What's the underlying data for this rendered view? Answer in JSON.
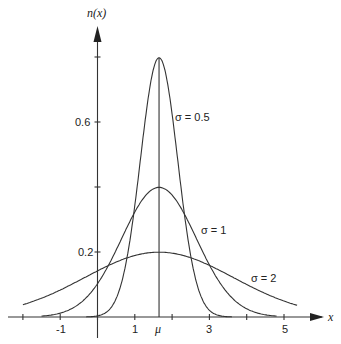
{
  "chart_data": {
    "type": "line",
    "title": "",
    "xlabel": "x",
    "ylabel": "n(x)",
    "xlim": [
      -2.4,
      5.8
    ],
    "ylim": [
      0,
      0.9
    ],
    "x_ticks": [
      -2,
      -1,
      0,
      1,
      2,
      3,
      4,
      5
    ],
    "x_tick_labels": [
      {
        "value": -1,
        "label": "-1"
      },
      {
        "value": 1,
        "label": "1"
      },
      {
        "value": 1.65,
        "label": "μ"
      },
      {
        "value": 3,
        "label": "3"
      },
      {
        "value": 5,
        "label": "5"
      }
    ],
    "y_ticks": [
      0.2,
      0.4,
      0.6,
      0.8
    ],
    "y_tick_labels": [
      {
        "value": 0.2,
        "label": "0.2"
      },
      {
        "value": 0.6,
        "label": "0.6"
      }
    ],
    "grid": false,
    "mean": 1.65,
    "series": [
      {
        "name": "σ = 0.5",
        "sigma": 0.5,
        "peak": 0.798
      },
      {
        "name": "σ = 1",
        "sigma": 1,
        "peak": 0.399
      },
      {
        "name": "σ = 2",
        "sigma": 2,
        "peak": 0.199
      }
    ],
    "annotations": [
      {
        "text": "σ = 0.5",
        "near_x": 2.1,
        "near_y": 0.6
      },
      {
        "text": "σ = 1",
        "near_x": 2.8,
        "near_y": 0.26
      },
      {
        "text": "σ = 2",
        "near_x": 4.0,
        "near_y": 0.14
      }
    ]
  },
  "labels": {
    "y_axis": "n(x)",
    "x_axis": "x",
    "mu": "μ",
    "s05": "σ = 0.5",
    "s1": "σ = 1",
    "s2": "σ = 2",
    "t_m1": "-1",
    "t_1": "1",
    "t_3": "3",
    "t_5": "5",
    "y02": "0.2",
    "y06": "0.6"
  }
}
